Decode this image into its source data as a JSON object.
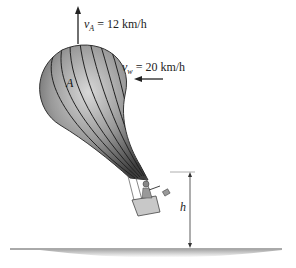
{
  "figure": {
    "type": "physics-diagram",
    "top_cutoff_text": "",
    "labels": {
      "balloon_velocity": {
        "symbol": "v",
        "subscript": "A",
        "value": "12",
        "unit": "km/h",
        "full": "vA = 12 km/h"
      },
      "wind_velocity": {
        "symbol": "v",
        "subscript": "w",
        "value": "20",
        "unit": "km/h",
        "full": "vw = 20 km/h"
      },
      "point_label": "A",
      "height_label": "h"
    },
    "colors": {
      "balloon_dark": "#4a4a4a",
      "balloon_light": "#bdbdbd",
      "arrow": "#222222",
      "ground": "#8a8a8a"
    }
  }
}
